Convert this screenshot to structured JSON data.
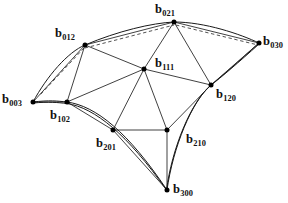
{
  "figure": {
    "width": 288,
    "height": 203,
    "background": "#ffffff",
    "stroke_color": "#1a1a1a",
    "vertex_color": "#000000"
  },
  "points": [
    {
      "id": "b003",
      "base": "b",
      "sub": "003",
      "x": 33,
      "y": 102,
      "label_x": 2,
      "label_y": 93,
      "label_anchor": "left"
    },
    {
      "id": "b012",
      "base": "b",
      "sub": "012",
      "x": 85,
      "y": 45,
      "label_x": 55,
      "label_y": 27,
      "label_anchor": "left"
    },
    {
      "id": "b021",
      "base": "b",
      "sub": "021",
      "x": 174,
      "y": 22,
      "label_x": 155,
      "label_y": 3,
      "label_anchor": "left"
    },
    {
      "id": "b030",
      "base": "b",
      "sub": "030",
      "x": 259,
      "y": 43,
      "label_x": 263,
      "label_y": 35,
      "label_anchor": "left"
    },
    {
      "id": "b102",
      "base": "b",
      "sub": "102",
      "x": 67,
      "y": 102,
      "label_x": 50,
      "label_y": 109,
      "label_anchor": "left"
    },
    {
      "id": "b111",
      "base": "b",
      "sub": "111",
      "x": 144,
      "y": 69,
      "label_x": 155,
      "label_y": 57,
      "label_anchor": "left"
    },
    {
      "id": "b120",
      "base": "b",
      "sub": "120",
      "x": 211,
      "y": 85,
      "label_x": 216,
      "label_y": 88,
      "label_anchor": "left"
    },
    {
      "id": "b201",
      "base": "b",
      "sub": "201",
      "x": 113,
      "y": 130,
      "label_x": 96,
      "label_y": 137,
      "label_anchor": "left"
    },
    {
      "id": "b210",
      "base": "b",
      "sub": "210",
      "x": 167,
      "y": 130,
      "label_x": 186,
      "label_y": 133,
      "label_anchor": "left"
    },
    {
      "id": "b300",
      "base": "b",
      "sub": "300",
      "x": 167,
      "y": 190,
      "label_x": 173,
      "label_y": 183,
      "label_anchor": "left"
    }
  ],
  "edges": [
    {
      "from": "b003",
      "to": "b012",
      "style": "solid"
    },
    {
      "from": "b003",
      "to": "b102",
      "style": "solid"
    },
    {
      "from": "b012",
      "to": "b102",
      "style": "solid"
    },
    {
      "from": "b012",
      "to": "b021",
      "style": "solid"
    },
    {
      "from": "b012",
      "to": "b111",
      "style": "solid"
    },
    {
      "from": "b021",
      "to": "b030",
      "style": "solid"
    },
    {
      "from": "b021",
      "to": "b111",
      "style": "solid"
    },
    {
      "from": "b021",
      "to": "b120",
      "style": "solid"
    },
    {
      "from": "b030",
      "to": "b120",
      "style": "solid"
    },
    {
      "from": "b102",
      "to": "b111",
      "style": "solid"
    },
    {
      "from": "b102",
      "to": "b201",
      "style": "solid"
    },
    {
      "from": "b111",
      "to": "b120",
      "style": "solid"
    },
    {
      "from": "b111",
      "to": "b201",
      "style": "solid"
    },
    {
      "from": "b111",
      "to": "b210",
      "style": "solid"
    },
    {
      "from": "b120",
      "to": "b210",
      "style": "solid"
    },
    {
      "from": "b201",
      "to": "b210",
      "style": "solid"
    },
    {
      "from": "b201",
      "to": "b300",
      "style": "solid"
    },
    {
      "from": "b210",
      "to": "b300",
      "style": "solid"
    }
  ],
  "dashed_edges": [
    {
      "from": "b012",
      "to": "b021",
      "note": "hidden-chord"
    },
    {
      "from": "b021",
      "to": "b030",
      "note": "hidden-chord"
    },
    {
      "from": "b012",
      "to": "b003",
      "note": "hidden-chord"
    }
  ],
  "boundary_curves": [
    {
      "id": "curve-left",
      "from": "b003",
      "via": [
        "b012",
        "b021"
      ],
      "to": "b030",
      "style": "curve"
    },
    {
      "id": "curve-bottom",
      "from": "b003",
      "via": [
        "b102",
        "b201"
      ],
      "to": "b300",
      "style": "curve"
    },
    {
      "id": "curve-right",
      "from": "b030",
      "via": [
        "b120",
        "b210"
      ],
      "to": "b300",
      "style": "curve"
    }
  ]
}
